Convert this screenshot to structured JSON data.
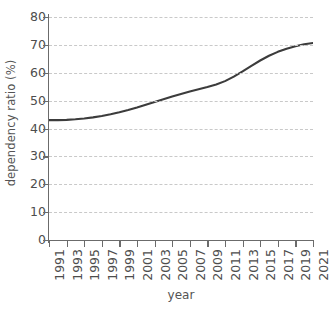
{
  "chart_data": {
    "type": "line",
    "title": "",
    "xlabel": "year",
    "ylabel": "dependency ratio (%)",
    "xlim": [
      1991,
      2021
    ],
    "ylim": [
      0,
      80
    ],
    "grid": true,
    "legend": false,
    "line_color": "#3c3c3c",
    "grid_color": "#c9c9c9",
    "axis_color": "#6b6b6b",
    "background": "#ffffff",
    "y_ticks": [
      0,
      10,
      20,
      30,
      40,
      50,
      60,
      70,
      80
    ],
    "y_tick_labels": [
      "0",
      "10",
      "20",
      "30",
      "40",
      "50",
      "60",
      "70",
      "80"
    ],
    "x_ticks": [
      1991,
      1993,
      1995,
      1997,
      1999,
      2001,
      2003,
      2005,
      2007,
      2009,
      2011,
      2013,
      2015,
      2017,
      2019,
      2021
    ],
    "x_tick_labels": [
      "1991",
      "1993",
      "1995",
      "1997",
      "1999",
      "2001",
      "2003",
      "2005",
      "2007",
      "2009",
      "2011",
      "2013",
      "2015",
      "2017",
      "2019",
      "2021"
    ],
    "x": [
      1991,
      1992,
      1993,
      1994,
      1995,
      1996,
      1997,
      1998,
      1999,
      2000,
      2001,
      2002,
      2003,
      2004,
      2005,
      2006,
      2007,
      2008,
      2009,
      2010,
      2011,
      2012,
      2013,
      2014,
      2015,
      2016,
      2017,
      2018,
      2019,
      2020,
      2021
    ],
    "values": [
      43.0,
      43.0,
      43.1,
      43.3,
      43.6,
      44.0,
      44.5,
      45.1,
      45.8,
      46.6,
      47.5,
      48.5,
      49.5,
      50.5,
      51.5,
      52.4,
      53.3,
      54.1,
      54.9,
      55.8,
      57.0,
      58.6,
      60.5,
      62.5,
      64.4,
      66.1,
      67.5,
      68.6,
      69.5,
      70.2,
      70.7
    ],
    "series_name": "dependency ratio"
  }
}
